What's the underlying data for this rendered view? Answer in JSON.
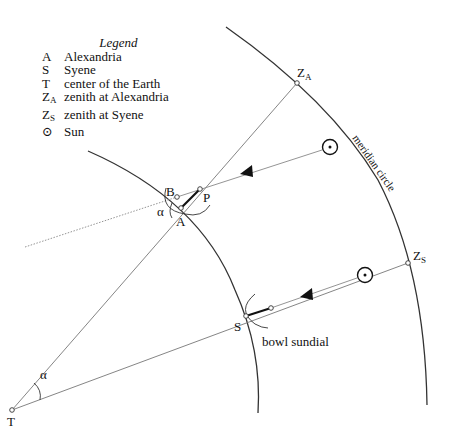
{
  "legend": {
    "title": "Legend",
    "items": [
      {
        "symbol": "A",
        "sub": "",
        "meaning": "Alexandria"
      },
      {
        "symbol": "S",
        "sub": "",
        "meaning": "Syene"
      },
      {
        "symbol": "T",
        "sub": "",
        "meaning": "center of the Earth"
      },
      {
        "symbol": "Z",
        "sub": "A",
        "meaning": "zenith at Alexandria"
      },
      {
        "symbol": "Z",
        "sub": "S",
        "meaning": "zenith at Syene"
      },
      {
        "symbol": "⊙",
        "sub": "",
        "meaning": "Sun"
      }
    ]
  },
  "labels": {
    "A": "A",
    "B": "B",
    "P": "P",
    "S": "S",
    "T": "T",
    "alpha_A": "α",
    "alpha_T": "α",
    "ZA_main": "Z",
    "ZA_sub": "A",
    "ZS_main": "Z",
    "ZS_sub": "S",
    "meridian": "meridian circle",
    "sundial": "bowl sundial"
  },
  "colors": {
    "line": "#333333",
    "ray": "#888888",
    "stroke_dark": "#111111"
  }
}
